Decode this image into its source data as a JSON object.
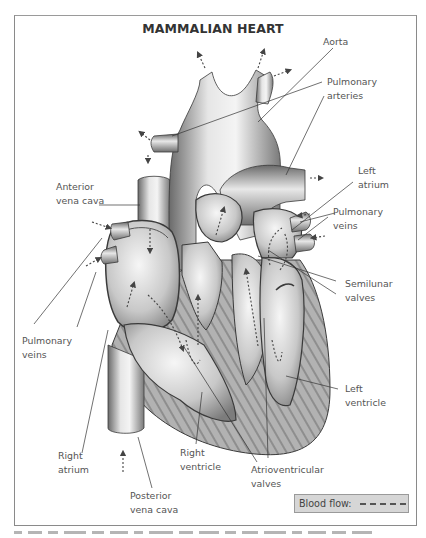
{
  "diagram": {
    "title": "MAMMALIAN HEART",
    "labels": {
      "aorta": "Aorta",
      "pulmonary_arteries": "Pulmonary\narteries",
      "left_atrium": "Left\natrium",
      "pulmonary_veins_right": "Pulmonary\nveins",
      "semilunar_valves": "Semilunar\nvalves",
      "left_ventricle": "Left\nventricle",
      "anterior_vena_cava": "Anterior\nvena cava",
      "pulmonary_veins_left": "Pulmonary\nveins",
      "right_atrium": "Right\natrium",
      "right_ventricle": "Right\nventricle",
      "atrioventricular_valves": "Atrioventricular\nvalves",
      "posterior_vena_cava": "Posterior\nvena cava"
    },
    "legend": {
      "label": "Blood flow:",
      "line_style": "dashed"
    },
    "colors": {
      "frame_border": "#8a8a8a",
      "text": "#555555",
      "title_text": "#333333",
      "legend_bg": "#d6d6d6",
      "heart_light": "#e8e8e8",
      "heart_mid": "#a8a8a8",
      "heart_dark": "#5a5a5a",
      "muscle": "#8c8c8c"
    }
  }
}
